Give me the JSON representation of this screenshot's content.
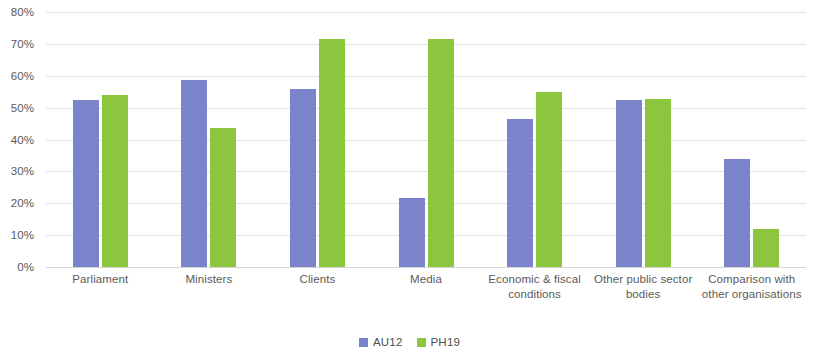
{
  "chart_data": {
    "type": "bar",
    "title": "",
    "xlabel": "",
    "ylabel": "",
    "ylim": [
      0,
      80
    ],
    "ytick_labels": [
      "80%",
      "70%",
      "60%",
      "50%",
      "40%",
      "30%",
      "20%",
      "10%",
      "0%"
    ],
    "ytick_values": [
      80,
      70,
      60,
      50,
      40,
      30,
      20,
      10,
      0
    ],
    "grid": true,
    "legend_position": "bottom",
    "categories": [
      "Parliament",
      "Ministers",
      "Clients",
      "Media",
      "Economic & fiscal conditions",
      "Other public sector bodies",
      "Comparison with other organisations"
    ],
    "series": [
      {
        "name": "AU12",
        "color": "#7b84ca",
        "values": [
          52.5,
          58.8,
          56.0,
          21.5,
          46.5,
          52.5,
          34.0
        ]
      },
      {
        "name": "PH19",
        "color": "#8cc63f",
        "values": [
          54.0,
          43.5,
          71.5,
          71.5,
          55.0,
          52.8,
          11.8
        ]
      }
    ]
  }
}
